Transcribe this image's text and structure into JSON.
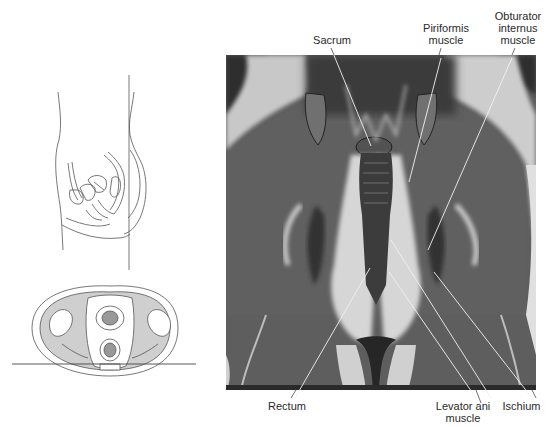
{
  "figure": {
    "type": "anatomical-mri-figure",
    "view": "coronal MRI of female pelvis with orientation diagrams",
    "orientation_diagrams": {
      "sagittal": "sagittal-pelvis-line-drawing",
      "axial": "axial-pelvis-cross-section-drawing"
    },
    "labels": {
      "sacrum": "Sacrum",
      "piriformis": "Piriformis\nmuscle",
      "obturator": "Obturator\ninternus\nmuscle",
      "rectum": "Rectum",
      "levator": "Levator ani\nmuscle",
      "ischium": "Ischium"
    },
    "colors": {
      "background": "#ffffff",
      "line_drawing": "#555555",
      "axial_fill": "#cfcfcf",
      "mri_dark": "#2b2b2b",
      "mri_mid": "#5c5c5c",
      "mri_light": "#d8d8d8"
    }
  }
}
